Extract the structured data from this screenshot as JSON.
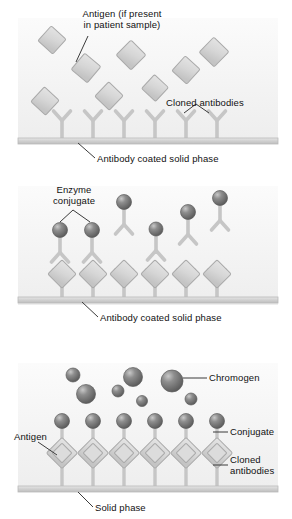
{
  "figure": {
    "colors": {
      "panel_background_top": "#fbfbfb",
      "panel_background_bottom": "#eeeeee",
      "antibody_gray": "#c9c9c9",
      "antibody_outline": "#b0b0b0",
      "antigen_fill": "#d8d8d8",
      "antigen_outline": "#a8a8a8",
      "sphere_dark": "#6e6e6e",
      "sphere_highlight": "#c2c2c2",
      "solid_phase": "#cfcfcf",
      "leader_line": "#444444",
      "text": "#111111"
    }
  },
  "panels": [
    {
      "id": "panel-1",
      "name": "antigen-capture-step",
      "labels": {
        "antigen": "Antigen (if present\nin patient sample)",
        "cloned_antibodies": "Cloned antibodies",
        "caption": "Antibody coated solid phase"
      },
      "counts": {
        "bound_antibodies": 6,
        "free_antigens": 7
      },
      "free_antigens": [
        {
          "x": 52,
          "y": 40,
          "size": 20,
          "rot": 42
        },
        {
          "x": 86,
          "y": 68,
          "size": 21,
          "rot": 40
        },
        {
          "x": 131,
          "y": 55,
          "size": 21,
          "rot": 45
        },
        {
          "x": 109,
          "y": 95,
          "size": 20,
          "rot": 44
        },
        {
          "x": 155,
          "y": 89,
          "size": 19,
          "rot": 43
        },
        {
          "x": 185,
          "y": 70,
          "size": 20,
          "rot": 42
        },
        {
          "x": 212,
          "y": 52,
          "size": 21,
          "rot": 44
        },
        {
          "x": 44,
          "y": 102,
          "size": 20,
          "rot": 43
        }
      ],
      "antibody_x": [
        62,
        93,
        124,
        155,
        186,
        217
      ]
    },
    {
      "id": "panel-2",
      "name": "enzyme-conjugate-step",
      "labels": {
        "enzyme_conjugate": "Enzyme\nconjugate",
        "caption": "Antibody coated solid phase"
      },
      "counts": {
        "bound_antigen_complexes": 6,
        "free_conjugates": 6
      },
      "free_conjugates": [
        {
          "x": 60,
          "y": 233,
          "sphere": 7.5,
          "ab_y": 243
        },
        {
          "x": 92,
          "y": 233,
          "sphere": 7.5,
          "ab_y": 243
        },
        {
          "x": 124,
          "y": 203,
          "sphere": 7.5,
          "ab_y": 213
        },
        {
          "x": 156,
          "y": 230,
          "sphere": 7.0,
          "ab_y": 240
        },
        {
          "x": 188,
          "y": 214,
          "sphere": 7.5,
          "ab_y": 224
        },
        {
          "x": 220,
          "y": 200,
          "sphere": 7.5,
          "ab_y": 210
        }
      ],
      "bound_x": [
        62,
        93,
        124,
        155,
        186,
        217
      ]
    },
    {
      "id": "panel-3",
      "name": "chromogen-detection-step",
      "labels": {
        "chromogen": "Chromogen",
        "antigen": "Antigen",
        "conjugate": "Conjugate",
        "cloned_antibodies": "Cloned\nantibodies",
        "caption": "Solid phase"
      },
      "counts": {
        "bound_stacks": 6,
        "free_chromogens": 7
      },
      "free_chromogens": [
        {
          "x": 73,
          "y": 375,
          "r": 7
        },
        {
          "x": 85,
          "y": 393,
          "r": 9.5
        },
        {
          "x": 118,
          "y": 391,
          "r": 6
        },
        {
          "x": 132,
          "y": 377,
          "r": 9.5
        },
        {
          "x": 141,
          "y": 400,
          "r": 5.5
        },
        {
          "x": 172,
          "y": 380,
          "r": 11
        },
        {
          "x": 190,
          "y": 398,
          "r": 6
        }
      ],
      "bound_x": [
        62,
        93,
        124,
        155,
        186,
        217
      ]
    }
  ]
}
